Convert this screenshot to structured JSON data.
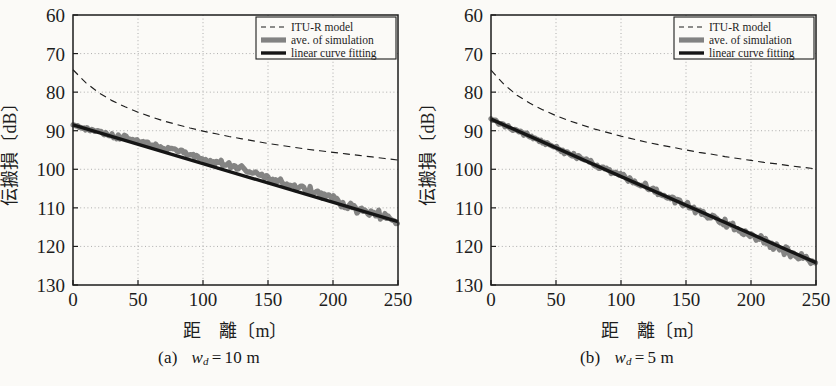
{
  "figure": {
    "background": "#fbfaf7",
    "ink": "#1d1d1d",
    "grid_color": "#9a9a9a",
    "sim_color": "#6e6e6e",
    "fit_color": "#151515"
  },
  "panels": [
    {
      "id": "a",
      "caption_label": "(a)",
      "caption_var": "w",
      "caption_sub": "d",
      "caption_eq": "=",
      "caption_value": "10 m",
      "caption_plain": "(a)  w_d = 10 m"
    },
    {
      "id": "b",
      "caption_label": "(b)",
      "caption_var": "w",
      "caption_sub": "d",
      "caption_eq": "=",
      "caption_value": "5 m",
      "caption_plain": "(b)  w_d = 5 m"
    }
  ],
  "legend": {
    "items": [
      {
        "label": "ITU-R model",
        "style": "dashed"
      },
      {
        "label": "ave. of simulation",
        "style": "thick-gray"
      },
      {
        "label": "linear curve fitting",
        "style": "thick-black"
      }
    ]
  },
  "axes": {
    "x": {
      "label": "距　離〔m〕",
      "ticks": [
        0,
        50,
        100,
        150,
        200,
        250
      ],
      "tick_labels": [
        "0",
        "50",
        "100",
        "150",
        "200",
        "250"
      ],
      "min": 0,
      "max": 250,
      "grid": true
    },
    "y": {
      "label": "伝搬損〔dB〕",
      "ticks": [
        60,
        70,
        80,
        90,
        100,
        110,
        120,
        130
      ],
      "tick_labels": [
        "60",
        "70",
        "80",
        "90",
        "100",
        "110",
        "120",
        "130"
      ],
      "min": 60,
      "max": 130,
      "inverted": true,
      "grid": true
    }
  },
  "chart_data": [
    {
      "type": "line",
      "title": "(a) w_d = 10 m",
      "xlabel": "距　離〔m〕",
      "ylabel": "伝搬損〔dB〕",
      "xlim": [
        0,
        250
      ],
      "ylim": [
        130,
        60
      ],
      "y_inverted": true,
      "grid": true,
      "legend_position": "top-right",
      "series": [
        {
          "name": "ITU-R model",
          "style": "dashed",
          "x": [
            0,
            10,
            20,
            30,
            40,
            50,
            60,
            70,
            80,
            90,
            100,
            110,
            120,
            130,
            140,
            150,
            160,
            170,
            180,
            190,
            200,
            210,
            220,
            230,
            240,
            250
          ],
          "values": [
            74.2,
            77.6,
            80.2,
            82.2,
            83.8,
            85.2,
            86.4,
            87.5,
            88.4,
            89.3,
            90.1,
            90.8,
            91.5,
            92.1,
            92.7,
            93.3,
            93.8,
            94.3,
            94.8,
            95.2,
            95.6,
            96.0,
            96.4,
            96.8,
            97.2,
            97.6
          ]
        },
        {
          "name": "ave. of simulation",
          "style": "thick-gray",
          "x": [
            0,
            10,
            20,
            30,
            40,
            50,
            60,
            70,
            80,
            90,
            100,
            110,
            120,
            130,
            140,
            150,
            160,
            170,
            180,
            190,
            200,
            210,
            220,
            230,
            240,
            250
          ],
          "values": [
            88.4,
            89.5,
            90.3,
            91.4,
            91.7,
            92.6,
            93.6,
            94.4,
            95.6,
            96.2,
            97.3,
            98.1,
            99.1,
            100.0,
            101.3,
            102.1,
            103.5,
            104.6,
            105.1,
            106.5,
            107.6,
            109.4,
            110.6,
            111.4,
            112.4,
            113.3
          ]
        },
        {
          "name": "linear curve fitting",
          "style": "thick-black",
          "x": [
            0,
            250
          ],
          "values": [
            88.5,
            113.6
          ],
          "slope_db_per_m": 0.1004,
          "intercept_db": 88.5
        }
      ]
    },
    {
      "type": "line",
      "title": "(b) w_d = 5 m",
      "xlabel": "距　離〔m〕",
      "ylabel": "伝搬損〔dB〕",
      "xlim": [
        0,
        250
      ],
      "ylim": [
        130,
        60
      ],
      "y_inverted": true,
      "grid": true,
      "legend_position": "top-right",
      "series": [
        {
          "name": "ITU-R model",
          "style": "dashed",
          "x": [
            0,
            10,
            20,
            30,
            40,
            50,
            60,
            70,
            80,
            90,
            100,
            110,
            120,
            130,
            140,
            150,
            160,
            170,
            180,
            190,
            200,
            210,
            220,
            230,
            240,
            250
          ],
          "values": [
            74.3,
            78.0,
            80.8,
            82.9,
            84.6,
            86.1,
            87.4,
            88.5,
            89.6,
            90.5,
            91.4,
            92.2,
            93.0,
            93.7,
            94.3,
            95.0,
            95.6,
            96.1,
            96.7,
            97.2,
            97.7,
            98.2,
            98.6,
            99.1,
            99.5,
            99.9
          ]
        },
        {
          "name": "ave. of simulation",
          "style": "thick-gray",
          "x": [
            0,
            10,
            20,
            30,
            40,
            50,
            60,
            70,
            80,
            90,
            100,
            110,
            120,
            130,
            140,
            150,
            160,
            170,
            180,
            190,
            200,
            210,
            220,
            230,
            240,
            250
          ],
          "values": [
            87.0,
            88.6,
            90.1,
            91.5,
            93.0,
            94.4,
            95.9,
            97.2,
            98.8,
            100.4,
            101.5,
            103.3,
            104.6,
            106.4,
            107.6,
            109.3,
            110.8,
            112.5,
            113.8,
            115.7,
            117.0,
            118.2,
            120.3,
            121.8,
            123.0,
            123.9
          ]
        },
        {
          "name": "linear curve fitting",
          "style": "thick-black",
          "x": [
            0,
            250
          ],
          "values": [
            87.0,
            124.2
          ],
          "slope_db_per_m": 0.1488,
          "intercept_db": 87.0
        }
      ]
    }
  ]
}
